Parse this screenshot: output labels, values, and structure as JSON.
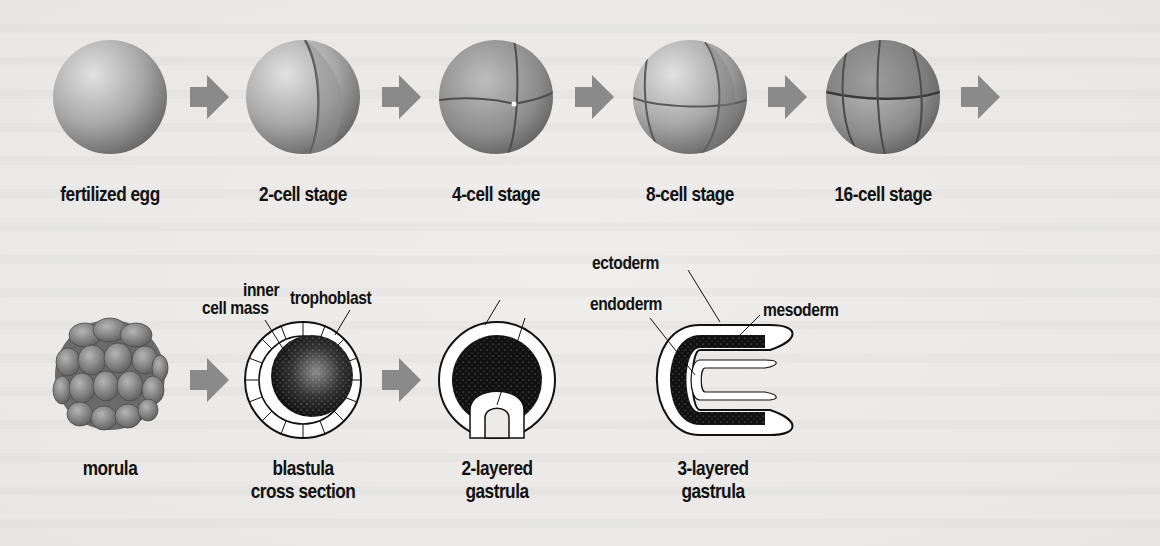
{
  "figure": {
    "colors": {
      "background": "#ecebe9",
      "arrow": "#8a8a8a",
      "sphere_light": "#d6d6d6",
      "sphere_dark": "#6e6e6e",
      "ink": "#111111"
    }
  },
  "row1": {
    "stages": [
      {
        "label": "fertilized egg",
        "cells": 1
      },
      {
        "label": "2-cell stage",
        "cells": 2
      },
      {
        "label": "4-cell stage",
        "cells": 4
      },
      {
        "label": "8-cell stage",
        "cells": 8
      },
      {
        "label": "16-cell stage",
        "cells": 16
      }
    ],
    "arrow_count": 5
  },
  "row2": {
    "stages": [
      {
        "label_line1": "morula",
        "label_line2": ""
      },
      {
        "label_line1": "blastula",
        "label_line2": "cross section"
      },
      {
        "label_line1": "2-layered",
        "label_line2": "gastrula"
      },
      {
        "label_line1": "3-layered",
        "label_line2": "gastrula"
      }
    ],
    "callouts": {
      "inner_cell_mass_line1": "inner",
      "inner_cell_mass_line2": "cell mass",
      "trophoblast": "trophoblast",
      "ectoderm": "ectoderm",
      "endoderm": "endoderm",
      "mesoderm": "mesoderm"
    },
    "arrow_count": 2
  }
}
